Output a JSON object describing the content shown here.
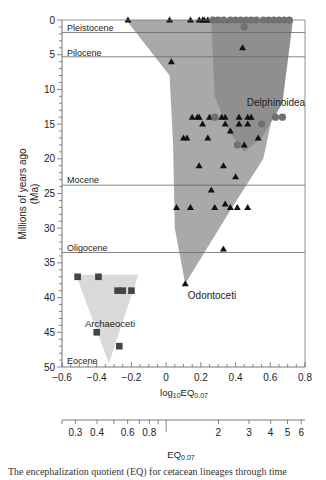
{
  "chart_data": {
    "type": "scatter",
    "title": "",
    "xlabel": "log10EQ0.07",
    "xlabel_parts": {
      "base": "log",
      "sub1": "10",
      "mid": "EQ",
      "sub2": "0.07"
    },
    "x2label_parts": {
      "base": "EQ",
      "sub": "0.07"
    },
    "ylabel": "Millions of years ago (Ma)",
    "ylabel_lines": [
      "Millions of years ago",
      "(Ma)"
    ],
    "xlim": [
      -0.6,
      0.8
    ],
    "ylim": [
      0,
      50
    ],
    "y_inverted": true,
    "x_ticks": [
      -0.6,
      -0.4,
      -0.2,
      0,
      0.2,
      0.4,
      0.6,
      0.8
    ],
    "x_tick_labels": [
      "−0.6",
      "−0.4",
      "−0.2",
      "0",
      "0.2",
      "0.4",
      "0.6",
      "0.8"
    ],
    "y_ticks": [
      0,
      5,
      10,
      15,
      20,
      25,
      30,
      35,
      40,
      45,
      50
    ],
    "y_tick_labels": [
      "0",
      "5",
      "10",
      "15",
      "20",
      "25",
      "30",
      "35",
      "40",
      "45",
      "50"
    ],
    "x2_ticks": [
      0.3,
      0.4,
      0.6,
      0.8,
      2,
      3,
      4,
      5,
      6
    ],
    "x2_tick_labels": [
      "0.3",
      "0.4",
      "0.6",
      "0.8",
      "2",
      "3",
      "4",
      "5",
      "6"
    ],
    "grid": false,
    "epochs": [
      {
        "name": "Pleistocene",
        "boundary_ma": 1.8
      },
      {
        "name": "Pilocene",
        "boundary_ma": 5.3
      },
      {
        "name": "Mocene",
        "boundary_ma": 23.8
      },
      {
        "name": "Oligocene",
        "boundary_ma": 33.5
      },
      {
        "name": "Eocene",
        "boundary_ma": 50
      }
    ],
    "regions": [
      {
        "name": "Odontoceti",
        "color": "#a9a9a9",
        "polygon": [
          [
            -0.23,
            0
          ],
          [
            0.73,
            0
          ],
          [
            0.56,
            20
          ],
          [
            0.38,
            27
          ],
          [
            0.11,
            38
          ],
          [
            0.05,
            30
          ],
          [
            0.04,
            18
          ],
          [
            0.02,
            8
          ]
        ]
      },
      {
        "name": "Delphinoidea",
        "color": "#8f8f8f",
        "polygon": [
          [
            0.26,
            0
          ],
          [
            0.73,
            0
          ],
          [
            0.67,
            12
          ],
          [
            0.55,
            17
          ],
          [
            0.45,
            19
          ],
          [
            0.36,
            16
          ],
          [
            0.28,
            11
          ]
        ]
      },
      {
        "name": "Archaeoceti",
        "color": "#d9d9d9",
        "polygon": [
          [
            -0.52,
            36.7
          ],
          [
            -0.16,
            36.7
          ],
          [
            -0.33,
            49.5
          ]
        ]
      }
    ],
    "series": [
      {
        "name": "Odontoceti",
        "marker": "triangle",
        "color": "#111111",
        "points": [
          [
            -0.22,
            0
          ],
          [
            0.02,
            0
          ],
          [
            0.14,
            0
          ],
          [
            0.19,
            0
          ],
          [
            0.21,
            0
          ],
          [
            0.22,
            0
          ],
          [
            0.24,
            0
          ],
          [
            0.26,
            0
          ],
          [
            0.29,
            0
          ],
          [
            0.34,
            0
          ],
          [
            0.44,
            4
          ],
          [
            0.03,
            6
          ],
          [
            0.15,
            14
          ],
          [
            0.18,
            14
          ],
          [
            0.19,
            14
          ],
          [
            0.25,
            14
          ],
          [
            0.32,
            14
          ],
          [
            0.34,
            14
          ],
          [
            0.42,
            14
          ],
          [
            0.47,
            14
          ],
          [
            0.49,
            14
          ],
          [
            0.21,
            15
          ],
          [
            0.34,
            15
          ],
          [
            0.42,
            15
          ],
          [
            0.47,
            15
          ],
          [
            0.37,
            16
          ],
          [
            0.53,
            17
          ],
          [
            0.1,
            17
          ],
          [
            0.12,
            17
          ],
          [
            0.24,
            17
          ],
          [
            0.45,
            18
          ],
          [
            0.19,
            21
          ],
          [
            0.33,
            21
          ],
          [
            0.4,
            22.6
          ],
          [
            0.26,
            24.5
          ],
          [
            0.34,
            26.5
          ],
          [
            0.06,
            27
          ],
          [
            0.14,
            27
          ],
          [
            0.28,
            27
          ],
          [
            0.37,
            27
          ],
          [
            0.41,
            27
          ],
          [
            0.47,
            27
          ],
          [
            0.33,
            33
          ],
          [
            0.11,
            38
          ]
        ]
      },
      {
        "name": "Delphinoidea",
        "marker": "circle",
        "color": "#707070",
        "points": [
          [
            0.27,
            0
          ],
          [
            0.3,
            0
          ],
          [
            0.33,
            0
          ],
          [
            0.37,
            0
          ],
          [
            0.4,
            0
          ],
          [
            0.43,
            0
          ],
          [
            0.46,
            0
          ],
          [
            0.49,
            0
          ],
          [
            0.52,
            0
          ],
          [
            0.56,
            0
          ],
          [
            0.59,
            0
          ],
          [
            0.62,
            0
          ],
          [
            0.65,
            0
          ],
          [
            0.68,
            0
          ],
          [
            0.71,
            0
          ],
          [
            0.45,
            1
          ],
          [
            0.28,
            14
          ],
          [
            0.63,
            14
          ],
          [
            0.67,
            14
          ],
          [
            0.55,
            15
          ],
          [
            0.41,
            18
          ]
        ]
      },
      {
        "name": "Archaeoceti",
        "marker": "square",
        "color": "#444444",
        "points": [
          [
            -0.51,
            37
          ],
          [
            -0.39,
            37
          ],
          [
            -0.28,
            39
          ],
          [
            -0.25,
            39
          ],
          [
            -0.2,
            39
          ],
          [
            -0.4,
            45
          ],
          [
            -0.27,
            47
          ]
        ]
      }
    ]
  },
  "labels": {
    "delphinoidea": "Delphinoidea",
    "odontoceti": "Odontoceti",
    "archaeoceti": "Archaeoceti",
    "pleistocene": "Pleistocene",
    "pilocene": "Pilocene",
    "mocene": "Mocene",
    "oligocene": "Oligocene",
    "eocene": "Eocene"
  },
  "caption": "The encephalization quotient (EQ) for cetacean lineages through time"
}
